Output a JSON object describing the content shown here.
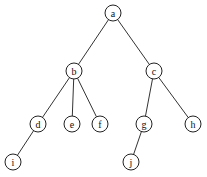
{
  "diagram": {
    "type": "tree",
    "nodes": [
      {
        "id": "a",
        "label": "a",
        "x": 113,
        "y": 13
      },
      {
        "id": "b",
        "label": "b",
        "x": 74,
        "y": 71
      },
      {
        "id": "c",
        "label": "c",
        "x": 154,
        "y": 71
      },
      {
        "id": "d",
        "label": "d",
        "x": 38,
        "y": 124
      },
      {
        "id": "e",
        "label": "e",
        "x": 72,
        "y": 124
      },
      {
        "id": "f",
        "label": "f",
        "x": 100,
        "y": 124
      },
      {
        "id": "g",
        "label": "g",
        "x": 144,
        "y": 124
      },
      {
        "id": "h",
        "label": "h",
        "x": 193,
        "y": 124
      },
      {
        "id": "i",
        "label": "i",
        "x": 13,
        "y": 162
      },
      {
        "id": "j",
        "label": "j",
        "x": 131,
        "y": 162
      }
    ],
    "edges": [
      [
        "a",
        "b"
      ],
      [
        "a",
        "c"
      ],
      [
        "b",
        "d"
      ],
      [
        "b",
        "e"
      ],
      [
        "b",
        "f"
      ],
      [
        "c",
        "g"
      ],
      [
        "c",
        "h"
      ],
      [
        "d",
        "i"
      ],
      [
        "g",
        "j"
      ]
    ]
  }
}
